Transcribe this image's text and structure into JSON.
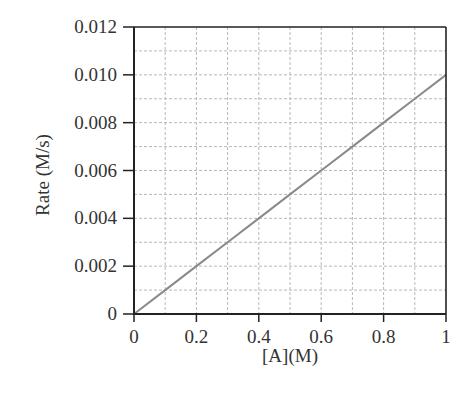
{
  "chart_data": {
    "type": "line",
    "title": "",
    "xlabel": "[A](M)",
    "ylabel": "Rate (M/s)",
    "xlim": [
      0,
      1
    ],
    "ylim": [
      0,
      0.012
    ],
    "x_ticks": [
      0,
      0.2,
      0.4,
      0.6,
      0.8,
      1
    ],
    "x_tick_labels": [
      "0",
      "0.2",
      "0.4",
      "0.6",
      "0.8",
      "1"
    ],
    "y_ticks": [
      0,
      0.002,
      0.004,
      0.006,
      0.008,
      0.01,
      0.012
    ],
    "y_tick_labels": [
      "0",
      "0.002",
      "0.004",
      "0.006",
      "0.008",
      "0.010",
      "0.012"
    ],
    "grid": true,
    "grid_x_step": 0.1,
    "grid_y_step": 0.001,
    "legend": null,
    "series": [
      {
        "name": "Rate",
        "x": [
          0,
          0.1,
          0.2,
          0.3,
          0.4,
          0.5,
          0.6,
          0.7,
          0.8,
          0.9,
          1.0
        ],
        "y": [
          0,
          0.001,
          0.002,
          0.003,
          0.004,
          0.005,
          0.006,
          0.007,
          0.008,
          0.009,
          0.01
        ],
        "color": "#8a8a8a"
      }
    ]
  },
  "colors": {
    "axis": "#222222",
    "grid": "#b8b8b8",
    "line": "#8a8a8a",
    "text": "#333333"
  }
}
